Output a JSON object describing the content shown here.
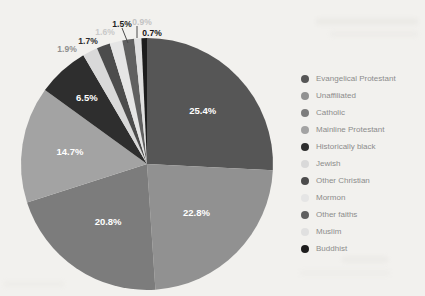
{
  "page": {
    "background_color": "#f2f1ee",
    "title": ""
  },
  "legend": {
    "position": "right",
    "text_color": "#8c8c8c"
  },
  "chart_data": {
    "type": "pie",
    "title": "",
    "xlabel": "",
    "ylabel": "",
    "legend_position": "right",
    "values_sum_shown": 98.5,
    "geometry": {
      "cx": 147,
      "cy": 164,
      "r": 126,
      "start_angle_deg": 0,
      "clockwise": true
    },
    "categories": [
      "Evangelical Protestant",
      "Unaffiliated",
      "Catholic",
      "Mainline Protestant",
      "Historically black",
      "Jewish",
      "Other Christian",
      "Mormon",
      "Other faiths",
      "Muslim",
      "Buddhist"
    ],
    "values": [
      25.4,
      22.8,
      20.8,
      14.7,
      6.5,
      1.9,
      1.7,
      1.6,
      1.5,
      0.9,
      0.7
    ],
    "slices": [
      {
        "label": "Evangelical Protestant",
        "value": 25.4,
        "pct_label": "25.4%",
        "color": "#565656",
        "label_placement": "inside",
        "label_r": 0.61
      },
      {
        "label": "Unaffiliated",
        "value": 22.8,
        "pct_label": "22.8%",
        "color": "#919191",
        "label_placement": "inside",
        "label_r": 0.55
      },
      {
        "label": "Catholic",
        "value": 20.8,
        "pct_label": "20.8%",
        "color": "#7c7c7c",
        "label_placement": "inside",
        "label_r": 0.55
      },
      {
        "label": "Mainline Protestant",
        "value": 14.7,
        "pct_label": "14.7%",
        "color": "#a3a3a3",
        "label_placement": "inside",
        "label_r": 0.62
      },
      {
        "label": "Historically black",
        "value": 6.5,
        "pct_label": "6.5%",
        "color": "#2e2e2e",
        "label_placement": "inside",
        "label_r": 0.71
      },
      {
        "label": "Jewish",
        "value": 1.9,
        "pct_label": "1.9%",
        "color": "#d9d9d9",
        "label_placement": "outside",
        "label_color": "#8f8f8f",
        "label_x": 67,
        "label_y": 49
      },
      {
        "label": "Other Christian",
        "value": 1.7,
        "pct_label": "1.7%",
        "color": "#4c4c4c",
        "label_placement": "outside",
        "label_color": "#2d2d2d",
        "label_x": 88,
        "label_y": 41
      },
      {
        "label": "Mormon",
        "value": 1.6,
        "pct_label": "1.6%",
        "color": "#e5e5e5",
        "label_placement": "outside",
        "label_color": "#c9c9c9",
        "label_x": 105,
        "label_y": 32
      },
      {
        "label": "Other faiths",
        "value": 1.5,
        "pct_label": "1.5%",
        "color": "#606060",
        "label_placement": "outside",
        "label_color": "#1f1f1f",
        "label_x": 122,
        "label_y": 24,
        "leader": {
          "x1": 122,
          "y1": 28,
          "x2": 128,
          "y2": 43
        }
      },
      {
        "label": "Muslim",
        "value": 0.9,
        "pct_label": "0.9%",
        "color": "#e0e0e0",
        "label_placement": "outside",
        "label_color": "#c3c3c3",
        "label_x": 142,
        "label_y": 22,
        "leader": {
          "x1": 137,
          "y1": 26,
          "x2": 137,
          "y2": 38
        }
      },
      {
        "label": "Buddhist",
        "value": 0.7,
        "pct_label": "0.7%",
        "color": "#1d1d1d",
        "label_placement": "outside",
        "label_color": "#141414",
        "label_x": 152,
        "label_y": 33
      }
    ],
    "leader_line_color": "#4a4a4a"
  }
}
